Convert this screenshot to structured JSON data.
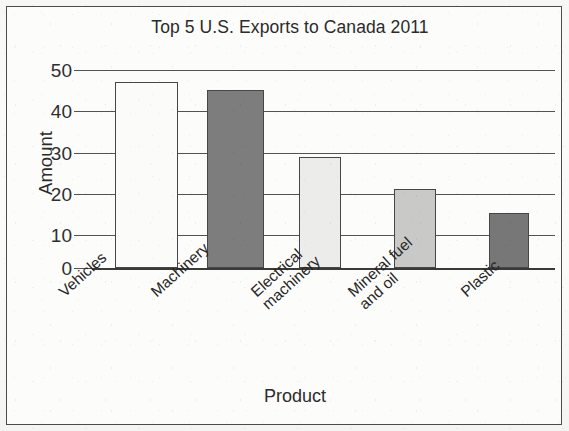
{
  "chart_data": {
    "type": "bar",
    "title": "Top 5 U.S. Exports to Canada 2011",
    "xlabel": "Product",
    "ylabel": "Amount",
    "categories": [
      "Vehicles",
      "Machinery",
      "Electrical machinery",
      "Mineral fuel and oil",
      "Plastic"
    ],
    "category_label_lines": [
      [
        "Vehicles"
      ],
      [
        "Machinery"
      ],
      [
        "Electrical",
        "machinery"
      ],
      [
        "Mineral fuel",
        "and oil"
      ],
      [
        "Plastic"
      ]
    ],
    "values": [
      47,
      45,
      28,
      20,
      14
    ],
    "bar_colors": [
      "#fbfbf9",
      "#7d7d7d",
      "#ececea",
      "#c9c9c7",
      "#777777"
    ],
    "ylim": [
      0,
      50
    ],
    "yticks": [
      0,
      10,
      20,
      30,
      40,
      50
    ],
    "ytick_labels": [
      "0",
      "10",
      "20",
      "30",
      "40",
      "50"
    ],
    "grid": true,
    "legend": false
  }
}
